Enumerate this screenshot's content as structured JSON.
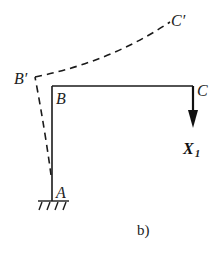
{
  "diagram": {
    "type": "frame-deflection",
    "nodes": {
      "A": {
        "label": "A"
      },
      "B": {
        "label": "B"
      },
      "C": {
        "label": "C"
      },
      "B_prime": {
        "label": "B′"
      },
      "C_prime": {
        "label": "C′"
      }
    },
    "force": {
      "label": "X",
      "subscript": "1",
      "direction": "down"
    },
    "caption": "b)",
    "support": "fixed"
  }
}
